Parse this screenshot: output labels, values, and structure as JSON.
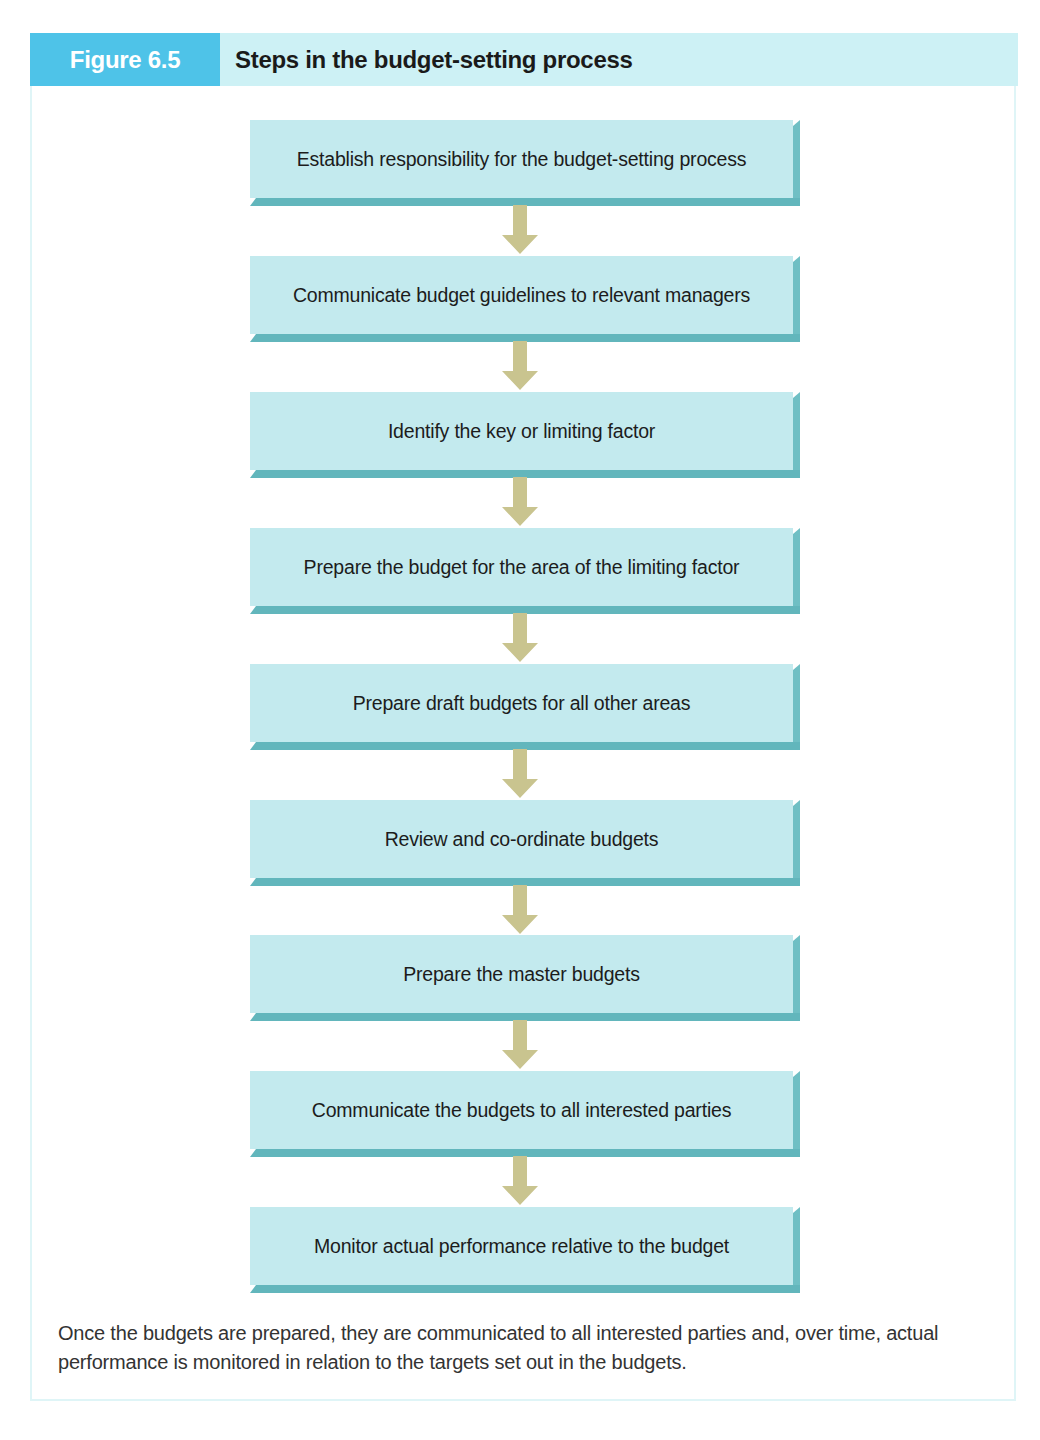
{
  "figure": {
    "label": "Figure 6.5",
    "title": "Steps in the budget-setting process",
    "colors": {
      "label_bg": "#4ec3e8",
      "header_bg": "#cdf1f5",
      "box_face": "#c3eaee",
      "box_edge": "#62b6bc",
      "arrow": "#c9c48f"
    }
  },
  "steps": [
    {
      "label": "Establish responsibility for the budget-setting process"
    },
    {
      "label": "Communicate budget guidelines to relevant managers"
    },
    {
      "label": "Identify the key or limiting factor"
    },
    {
      "label": "Prepare the budget for the area of the limiting factor"
    },
    {
      "label": "Prepare draft budgets for all other areas"
    },
    {
      "label": "Review and co-ordinate budgets"
    },
    {
      "label": "Prepare the master budgets"
    },
    {
      "label": "Communicate the budgets to all interested parties"
    },
    {
      "label": "Monitor actual performance relative to the budget"
    }
  ],
  "arrows": [
    {
      "icon": "arrow-down-icon",
      "from": 0,
      "to": 1
    },
    {
      "icon": "arrow-down-icon",
      "from": 1,
      "to": 2
    },
    {
      "icon": "arrow-down-icon",
      "from": 2,
      "to": 3
    },
    {
      "icon": "arrow-down-icon",
      "from": 3,
      "to": 4
    },
    {
      "icon": "arrow-down-icon",
      "from": 4,
      "to": 5
    },
    {
      "icon": "arrow-down-icon",
      "from": 5,
      "to": 6
    },
    {
      "icon": "arrow-down-icon",
      "from": 6,
      "to": 7
    },
    {
      "icon": "arrow-down-icon",
      "from": 7,
      "to": 8
    }
  ],
  "caption": "Once the budgets are prepared, they are communicated to all interested parties and, over time, actual performance is monitored in relation to the targets set out in the budgets."
}
